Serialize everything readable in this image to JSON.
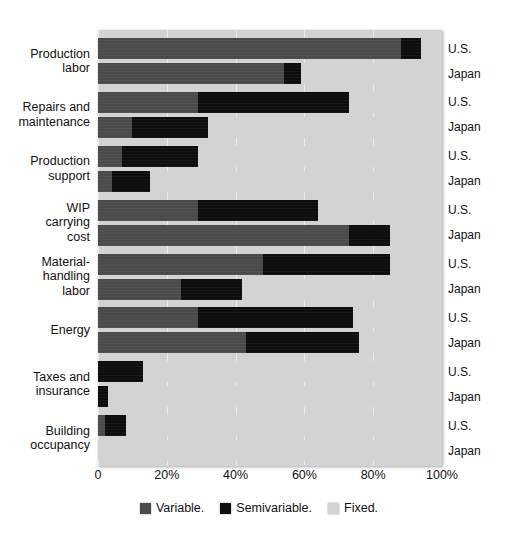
{
  "chart_data": {
    "type": "bar",
    "orientation": "horizontal",
    "stacked": true,
    "normalized": true,
    "title": "",
    "subtitle": "",
    "xlabel": "",
    "ylabel": "",
    "xlim": [
      0,
      100
    ],
    "xticks": [
      0,
      20,
      40,
      60,
      80,
      100
    ],
    "xtick_labels": [
      "0",
      "20%",
      "40%",
      "60%",
      "80%",
      "100%"
    ],
    "grid": true,
    "grid_axis": "x",
    "legend_position": "bottom",
    "legend": [
      {
        "name": "Variable.",
        "color": "#4a4a4a"
      },
      {
        "name": "Semivariable.",
        "color": "#0d0d0d"
      },
      {
        "name": "Fixed.",
        "color": "#d3d3d3"
      }
    ],
    "series_names": [
      "Variable.",
      "Semivariable.",
      "Fixed."
    ],
    "categories": [
      "Production labor",
      "Repairs and maintenance",
      "Production support",
      "WIP carrying cost",
      "Material-handling labor",
      "Energy",
      "Taxes and insurance",
      "Building occupancy"
    ],
    "groups": [
      {
        "category": "Production labor",
        "label_lines": [
          "Production",
          "labor"
        ],
        "rows": [
          {
            "country": "U.S.",
            "variable": 88,
            "semivariable": 6,
            "fixed": 6
          },
          {
            "country": "Japan",
            "variable": 54,
            "semivariable": 5,
            "fixed": 41
          }
        ]
      },
      {
        "category": "Repairs and maintenance",
        "label_lines": [
          "Repairs and",
          "maintenance"
        ],
        "rows": [
          {
            "country": "U.S.",
            "variable": 29,
            "semivariable": 44,
            "fixed": 27
          },
          {
            "country": "Japan",
            "variable": 10,
            "semivariable": 22,
            "fixed": 68
          }
        ]
      },
      {
        "category": "Production support",
        "label_lines": [
          "Production",
          "support"
        ],
        "rows": [
          {
            "country": "U.S.",
            "variable": 7,
            "semivariable": 22,
            "fixed": 71
          },
          {
            "country": "Japan",
            "variable": 4,
            "semivariable": 11,
            "fixed": 85
          }
        ]
      },
      {
        "category": "WIP carrying cost",
        "label_lines": [
          "WIP",
          "carrying",
          "cost"
        ],
        "rows": [
          {
            "country": "U.S.",
            "variable": 29,
            "semivariable": 35,
            "fixed": 36
          },
          {
            "country": "Japan",
            "variable": 73,
            "semivariable": 12,
            "fixed": 15
          }
        ]
      },
      {
        "category": "Material-handling labor",
        "label_lines": [
          "Material-",
          "handling",
          "labor"
        ],
        "rows": [
          {
            "country": "U.S.",
            "variable": 48,
            "semivariable": 37,
            "fixed": 15
          },
          {
            "country": "Japan",
            "variable": 24,
            "semivariable": 18,
            "fixed": 58
          }
        ]
      },
      {
        "category": "Energy",
        "label_lines": [
          "Energy"
        ],
        "rows": [
          {
            "country": "U.S.",
            "variable": 29,
            "semivariable": 45,
            "fixed": 26
          },
          {
            "country": "Japan",
            "variable": 43,
            "semivariable": 33,
            "fixed": 24
          }
        ]
      },
      {
        "category": "Taxes and insurance",
        "label_lines": [
          "Taxes and",
          "insurance"
        ],
        "rows": [
          {
            "country": "U.S.",
            "variable": 0,
            "semivariable": 13,
            "fixed": 87
          },
          {
            "country": "Japan",
            "variable": 0,
            "semivariable": 3,
            "fixed": 97
          }
        ]
      },
      {
        "category": "Building occupancy",
        "label_lines": [
          "Building",
          "occupancy"
        ],
        "rows": [
          {
            "country": "U.S.",
            "variable": 2,
            "semivariable": 6,
            "fixed": 92
          },
          {
            "country": "Japan",
            "variable": 0,
            "semivariable": 0,
            "fixed": 100
          }
        ]
      }
    ]
  },
  "colors": {
    "variable": "#4a4a4a",
    "semivariable": "#0d0d0d",
    "fixed": "#d3d3d3",
    "panel_background": "#d3d3d3",
    "page_background": "#ffffff",
    "text": "#111111"
  }
}
